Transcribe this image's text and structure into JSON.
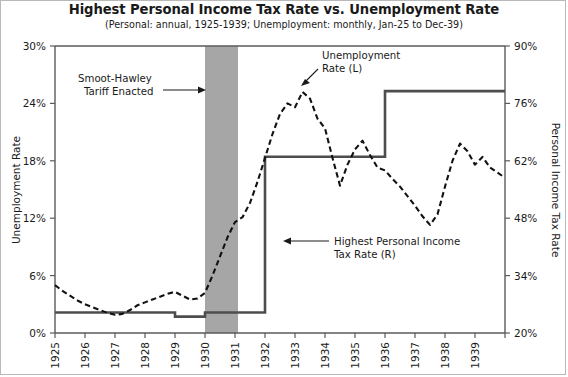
{
  "chart_data": {
    "type": "line",
    "title": "Highest Personal Income Tax Rate vs. Unemployment Rate",
    "subtitle": "(Personal: annual, 1925-1939; Unemployment: monthly, Jan-25 to Dec-39)",
    "xlabel": "",
    "ylabel": "Unemployment Rate",
    "y2label": "Personal Income Tax Rate",
    "grid": false,
    "legend_position": "inline-annotations",
    "xlim": [
      1925,
      1940
    ],
    "ylim": [
      0,
      30
    ],
    "y2lim": [
      20,
      90
    ],
    "x_tick_labels": [
      "1925",
      "1926",
      "1927",
      "1928",
      "1929",
      "1930",
      "1931",
      "1932",
      "1933",
      "1934",
      "1935",
      "1936",
      "1937",
      "1938",
      "1939"
    ],
    "y_tick_labels": [
      "0%",
      "6%",
      "12%",
      "18%",
      "24%",
      "30%"
    ],
    "y_tick_values": [
      0,
      6,
      12,
      18,
      24,
      30
    ],
    "y2_tick_labels": [
      "20%",
      "34%",
      "48%",
      "62%",
      "76%",
      "90%"
    ],
    "y2_tick_values": [
      20,
      34,
      48,
      62,
      76,
      90
    ],
    "series": [
      {
        "name": "Unemployment Rate (L)",
        "axis": "left",
        "style": "dashed",
        "units": "percent",
        "frequency": "monthly",
        "x": [
          1925.0,
          1925.25,
          1925.5,
          1925.75,
          1926.0,
          1926.25,
          1926.5,
          1926.75,
          1927.0,
          1927.25,
          1927.5,
          1927.75,
          1928.0,
          1928.25,
          1928.5,
          1928.75,
          1929.0,
          1929.25,
          1929.5,
          1929.75,
          1930.0,
          1930.25,
          1930.5,
          1930.75,
          1931.0,
          1931.25,
          1931.5,
          1931.75,
          1932.0,
          1932.25,
          1932.5,
          1932.75,
          1933.0,
          1933.25,
          1933.5,
          1933.75,
          1934.0,
          1934.25,
          1934.5,
          1934.75,
          1935.0,
          1935.25,
          1935.5,
          1935.75,
          1936.0,
          1936.25,
          1936.5,
          1936.75,
          1937.0,
          1937.25,
          1937.5,
          1937.75,
          1938.0,
          1938.25,
          1938.5,
          1938.75,
          1939.0,
          1939.25,
          1939.5,
          1939.92
        ],
        "values": [
          5.0,
          4.4,
          3.9,
          3.4,
          3.0,
          2.7,
          2.4,
          2.1,
          1.9,
          2.0,
          2.4,
          2.9,
          3.2,
          3.5,
          3.8,
          4.1,
          4.3,
          3.9,
          3.5,
          3.6,
          4.2,
          6.0,
          8.0,
          10.0,
          11.6,
          12.1,
          13.6,
          15.8,
          18.3,
          20.8,
          22.9,
          24.0,
          23.6,
          25.2,
          24.5,
          22.4,
          21.4,
          18.3,
          15.4,
          17.6,
          19.2,
          20.1,
          18.6,
          17.3,
          17.0,
          16.1,
          15.3,
          14.3,
          13.3,
          12.2,
          11.3,
          12.4,
          15.3,
          18.0,
          19.8,
          19.0,
          17.6,
          18.4,
          17.3,
          16.4
        ]
      },
      {
        "name": "Highest Personal Income Tax Rate (R)",
        "axis": "right",
        "style": "step",
        "units": "percent",
        "frequency": "annual",
        "x": [
          1925,
          1926,
          1927,
          1928,
          1929,
          1930,
          1931,
          1932,
          1933,
          1934,
          1935,
          1936,
          1937,
          1938,
          1939,
          1940
        ],
        "values": [
          25,
          25,
          25,
          25,
          24,
          25,
          25,
          63,
          63,
          63,
          63,
          79,
          79,
          79,
          79,
          79
        ]
      }
    ],
    "shaded_regions": [
      {
        "name": "smoot-hawley-band",
        "x_start": 1930.0,
        "x_end": 1931.1,
        "color": "#a6a6a6"
      }
    ],
    "annotations": [
      {
        "name": "smoot-hawley-annotation",
        "line1": "Smoot-Hawley",
        "line2": "Tariff Enacted"
      },
      {
        "name": "unemployment-series-annotation",
        "line1": "Unemployment",
        "line2": "Rate (L)"
      },
      {
        "name": "tax-rate-series-annotation",
        "line1": "Highest Personal Income",
        "line2": "Tax Rate (R)"
      }
    ],
    "colors": {
      "unemployment_line": "#121212",
      "tax_line": "#4d4d4d",
      "band": "#a6a6a6",
      "axis": "#5a5a5a",
      "text": "#1a1a1a",
      "background": "#ffffff"
    }
  }
}
